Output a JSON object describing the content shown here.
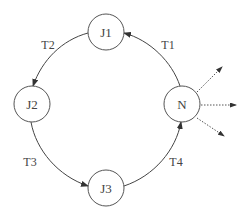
{
  "diagram": {
    "nodes": [
      {
        "id": "J1",
        "label": "J1",
        "cx": 106,
        "cy": 32
      },
      {
        "id": "J2",
        "label": "J2",
        "cx": 32,
        "cy": 104
      },
      {
        "id": "J3",
        "label": "J3",
        "cx": 106,
        "cy": 188
      },
      {
        "id": "N",
        "label": "N",
        "cx": 182,
        "cy": 104
      }
    ],
    "edges": [
      {
        "from": "N",
        "to": "J1",
        "label": "T1"
      },
      {
        "from": "J1",
        "to": "J2",
        "label": "T2"
      },
      {
        "from": "J2",
        "to": "J3",
        "label": "T3"
      },
      {
        "from": "J3",
        "to": "N",
        "label": "T4"
      }
    ],
    "outgoing": {
      "from": "N",
      "count": 3,
      "style": "dotted"
    },
    "colors": {
      "stroke": "#444444",
      "background": "#ffffff"
    }
  }
}
